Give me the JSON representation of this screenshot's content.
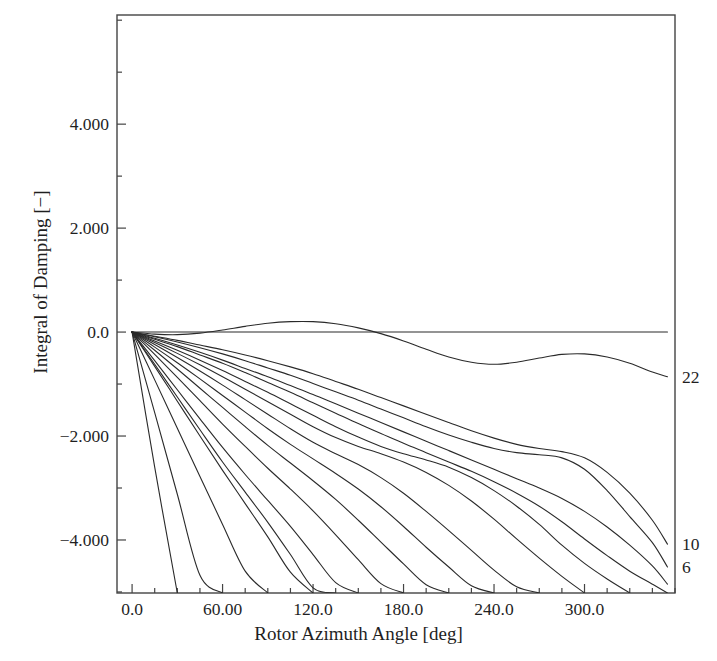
{
  "chart_data": {
    "type": "line",
    "title": "",
    "xlabel": "Rotor Azimuth Angle [deg]",
    "ylabel": "Integral of Damping [−]",
    "xlim": [
      -10,
      360
    ],
    "ylim": [
      -5.02,
      6.1
    ],
    "grid": false,
    "legend_position": "right-edge-inline",
    "xticks": [
      0,
      60,
      120,
      180,
      240,
      300
    ],
    "xtick_labels": [
      "0.0",
      "60.00",
      "120.0",
      "180.0",
      "240.0",
      "300.0"
    ],
    "xtick_minor_step": 15,
    "yticks": [
      4,
      2,
      0,
      -2,
      -4
    ],
    "ytick_labels": [
      "4.000",
      "2.000",
      "0.0",
      "−2.000",
      "−4.000"
    ],
    "ytick_minor_step": 1,
    "line_color": "#2a2a2a",
    "line_width": 1.1,
    "background": "#ffffff",
    "frame_color": "#444444",
    "edge_labels": [
      {
        "text": "22",
        "y_value": -0.86
      },
      {
        "text": "10",
        "y_value": -4.08
      },
      {
        "text": "6",
        "y_value": -4.52
      }
    ],
    "x": [
      0,
      15,
      30,
      45,
      60,
      75,
      90,
      105,
      120,
      135,
      150,
      165,
      180,
      195,
      210,
      225,
      240,
      255,
      270,
      285,
      300,
      315,
      330,
      345,
      355
    ],
    "series": [
      {
        "name": "22",
        "values": [
          0.0,
          -0.04,
          -0.05,
          -0.02,
          0.04,
          0.11,
          0.17,
          0.2,
          0.2,
          0.16,
          0.08,
          -0.03,
          -0.17,
          -0.33,
          -0.48,
          -0.58,
          -0.62,
          -0.58,
          -0.5,
          -0.43,
          -0.42,
          -0.48,
          -0.6,
          -0.77,
          -0.86
        ]
      },
      {
        "name": "20",
        "values": [
          0.0,
          -0.08,
          -0.16,
          -0.25,
          -0.34,
          -0.44,
          -0.55,
          -0.67,
          -0.8,
          -0.95,
          -1.1,
          -1.26,
          -1.42,
          -1.58,
          -1.74,
          -1.9,
          -2.04,
          -2.16,
          -2.24,
          -2.3,
          -2.42,
          -2.7,
          -3.1,
          -3.62,
          -4.08
        ]
      },
      {
        "name": "18",
        "values": [
          0.0,
          -0.09,
          -0.19,
          -0.3,
          -0.42,
          -0.55,
          -0.69,
          -0.83,
          -0.99,
          -1.15,
          -1.31,
          -1.48,
          -1.65,
          -1.82,
          -1.98,
          -2.12,
          -2.24,
          -2.32,
          -2.36,
          -2.42,
          -2.64,
          -3.05,
          -3.55,
          -4.05,
          -4.52
        ]
      },
      {
        "name": "16",
        "values": [
          0.0,
          -0.12,
          -0.25,
          -0.39,
          -0.54,
          -0.7,
          -0.86,
          -1.03,
          -1.2,
          -1.38,
          -1.56,
          -1.74,
          -1.92,
          -2.1,
          -2.28,
          -2.46,
          -2.64,
          -2.82,
          -3.0,
          -3.2,
          -3.45,
          -3.75,
          -4.1,
          -4.5,
          -4.85
        ]
      },
      {
        "name": "15",
        "values": [
          0.0,
          -0.14,
          -0.28,
          -0.44,
          -0.6,
          -0.78,
          -0.97,
          -1.16,
          -1.36,
          -1.56,
          -1.76,
          -1.95,
          -2.14,
          -2.32,
          -2.5,
          -2.68,
          -2.88,
          -3.1,
          -3.35,
          -3.65,
          -3.98,
          -4.3,
          -4.6,
          -4.85,
          -5.02
        ]
      },
      {
        "name": "14",
        "values": [
          0.0,
          -0.17,
          -0.35,
          -0.54,
          -0.74,
          -0.95,
          -1.16,
          -1.38,
          -1.6,
          -1.82,
          -2.02,
          -2.2,
          -2.34,
          -2.46,
          -2.6,
          -2.8,
          -3.05,
          -3.35,
          -3.7,
          -4.1,
          -4.45,
          -4.75,
          -5.02,
          null,
          null
        ]
      },
      {
        "name": "13",
        "values": [
          0.0,
          -0.2,
          -0.41,
          -0.63,
          -0.86,
          -1.1,
          -1.34,
          -1.58,
          -1.82,
          -2.03,
          -2.2,
          -2.34,
          -2.5,
          -2.7,
          -2.95,
          -3.25,
          -3.6,
          -3.98,
          -4.35,
          -4.7,
          -5.02,
          null,
          null,
          null,
          null
        ]
      },
      {
        "name": "12",
        "values": [
          0.0,
          -0.24,
          -0.49,
          -0.75,
          -1.02,
          -1.3,
          -1.58,
          -1.86,
          -2.12,
          -2.34,
          -2.55,
          -2.8,
          -3.1,
          -3.45,
          -3.82,
          -4.2,
          -4.58,
          -4.9,
          -5.02,
          null,
          null,
          null,
          null,
          null,
          null
        ]
      },
      {
        "name": "11",
        "values": [
          0.0,
          -0.29,
          -0.59,
          -0.9,
          -1.22,
          -1.54,
          -1.86,
          -2.16,
          -2.44,
          -2.72,
          -3.02,
          -3.36,
          -3.74,
          -4.14,
          -4.52,
          -4.88,
          -5.02,
          null,
          null,
          null,
          null,
          null,
          null,
          null,
          null
        ]
      },
      {
        "name": "10",
        "values": [
          0.0,
          -0.35,
          -0.71,
          -1.08,
          -1.45,
          -1.82,
          -2.18,
          -2.52,
          -2.86,
          -3.22,
          -3.62,
          -4.04,
          -4.46,
          -4.86,
          -5.02,
          null,
          null,
          null,
          null,
          null,
          null,
          null,
          null,
          null,
          null
        ]
      },
      {
        "name": "9",
        "values": [
          0.0,
          -0.43,
          -0.87,
          -1.32,
          -1.77,
          -2.2,
          -2.62,
          -3.02,
          -3.44,
          -3.9,
          -4.38,
          -4.84,
          -5.02,
          null,
          null,
          null,
          null,
          null,
          null,
          null,
          null,
          null,
          null,
          null,
          null
        ]
      },
      {
        "name": "8",
        "values": [
          0.0,
          -0.55,
          -1.11,
          -1.67,
          -2.22,
          -2.74,
          -3.24,
          -3.74,
          -4.28,
          -4.82,
          -5.02,
          null,
          null,
          null,
          null,
          null,
          null,
          null,
          null,
          null,
          null,
          null,
          null,
          null,
          null
        ]
      },
      {
        "name": "7",
        "values": [
          0.0,
          -0.62,
          -1.25,
          -1.88,
          -2.5,
          -3.08,
          -3.66,
          -4.28,
          -4.92,
          -5.02,
          null,
          null,
          null,
          null,
          null,
          null,
          null,
          null,
          null,
          null,
          null,
          null,
          null,
          null,
          null
        ]
      },
      {
        "name": "6",
        "values": [
          0.0,
          -0.66,
          -1.33,
          -2.0,
          -2.66,
          -3.3,
          -3.94,
          -4.62,
          -5.02,
          null,
          null,
          null,
          null,
          null,
          null,
          null,
          null,
          null,
          null,
          null,
          null,
          null,
          null,
          null,
          null
        ]
      },
      {
        "name": "5",
        "values": [
          0.0,
          -0.92,
          -1.85,
          -2.78,
          -3.7,
          -4.6,
          -5.02,
          null,
          null,
          null,
          null,
          null,
          null,
          null,
          null,
          null,
          null,
          null,
          null,
          null,
          null,
          null,
          null,
          null,
          null
        ]
      },
      {
        "name": "4",
        "values": [
          0.0,
          -1.55,
          -3.12,
          -4.68,
          -5.02,
          null,
          null,
          null,
          null,
          null,
          null,
          null,
          null,
          null,
          null,
          null,
          null,
          null,
          null,
          null,
          null,
          null,
          null,
          null,
          null
        ]
      },
      {
        "name": "3",
        "values": [
          0.0,
          -2.6,
          -5.02,
          null,
          null,
          null,
          null,
          null,
          null,
          null,
          null,
          null,
          null,
          null,
          null,
          null,
          null,
          null,
          null,
          null,
          null,
          null,
          null,
          null,
          null
        ]
      },
      {
        "name": "zero-line",
        "values": [
          0.0,
          0.0,
          0.0,
          0.0,
          0.0,
          0.0,
          0.0,
          0.0,
          0.0,
          0.0,
          0.0,
          0.0,
          0.0,
          0.0,
          0.0,
          0.0,
          0.0,
          0.0,
          0.0,
          0.0,
          0.0,
          0.0,
          0.0,
          0.0,
          0.0
        ]
      }
    ]
  }
}
